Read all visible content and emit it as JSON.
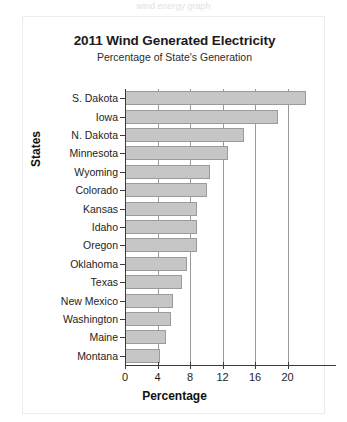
{
  "top_cut_text": "wind energy graph",
  "chart_data": {
    "type": "bar",
    "orientation": "horizontal",
    "title": "2011 Wind Generated Electricity",
    "subtitle": "Percentage of State's Generation",
    "xlabel": "Percentage",
    "ylabel": "States",
    "xlim": [
      0,
      23.5
    ],
    "xticks": [
      0,
      4,
      8,
      12,
      16,
      20
    ],
    "xticklabels": [
      "0",
      "4",
      "8",
      "12",
      "16",
      "20"
    ],
    "grid": "vertical",
    "legend": null,
    "bar_color": "#c6c6c6",
    "bar_edge_color": "#9b9b9b",
    "categories": [
      "S. Dakota",
      "Iowa",
      "N. Dakota",
      "Minnesota",
      "Wyoming",
      "Colorado",
      "Kansas",
      "Idaho",
      "Oregon",
      "Oklahoma",
      "Texas",
      "New Mexico",
      "Washington",
      "Maine",
      "Montana"
    ],
    "values": [
      22.3,
      18.8,
      14.7,
      12.7,
      10.5,
      10.1,
      8.8,
      8.8,
      8.8,
      7.6,
      7.0,
      5.9,
      5.6,
      5.0,
      4.3
    ]
  }
}
